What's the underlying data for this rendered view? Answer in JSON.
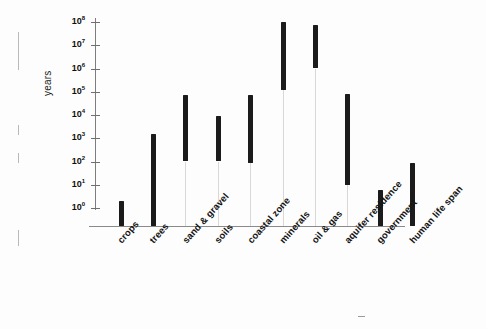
{
  "figure": {
    "ylabel": "years",
    "scan_artifacts": [
      "binding-mark",
      "binding-mark",
      "binding-mark",
      "binding-mark",
      "stray-dot"
    ]
  },
  "axis": {
    "ticks": [
      {
        "exp": "8",
        "base": "10",
        "value": 100000000
      },
      {
        "exp": "7",
        "base": "10",
        "value": 10000000
      },
      {
        "exp": "6",
        "base": "10",
        "value": 1000000
      },
      {
        "exp": "5",
        "base": "10",
        "value": 100000
      },
      {
        "exp": "4",
        "base": "10",
        "value": 10000
      },
      {
        "exp": "3",
        "base": "10",
        "value": 1000
      },
      {
        "exp": "2",
        "base": "10",
        "value": 100
      },
      {
        "exp": "1",
        "base": "10",
        "value": 10
      },
      {
        "exp": "0",
        "base": "10",
        "value": 1
      }
    ]
  },
  "chart_data": {
    "type": "bar",
    "title": "",
    "xlabel": "",
    "ylabel": "years",
    "scale": "log",
    "ylim": [
      1,
      100000000
    ],
    "grid": false,
    "legend": null,
    "orientation": "vertical",
    "bar_style": "floating range bars (low-high)",
    "categories": [
      "crops",
      "trees",
      "sand & gravel",
      "soils",
      "coastal zone",
      "minerals",
      "oil & gas",
      "aquifer residence",
      "government",
      "human life span"
    ],
    "series": [
      {
        "name": "renewal time range (years)",
        "low": [
          1,
          1,
          100,
          100,
          90,
          120000,
          1000000,
          10,
          1,
          1
        ],
        "high": [
          2,
          1600,
          70000,
          9000,
          70000,
          100000000,
          70000000,
          80000,
          6,
          85
        ]
      }
    ],
    "values_log10": [
      {
        "category": "crops",
        "low_log": 0.0,
        "high_log": 0.3
      },
      {
        "category": "trees",
        "low_log": 0.0,
        "high_log": 3.2
      },
      {
        "category": "sand & gravel",
        "low_log": 2.0,
        "high_log": 4.85
      },
      {
        "category": "soils",
        "low_log": 2.0,
        "high_log": 3.95
      },
      {
        "category": "coastal zone",
        "low_log": 1.95,
        "high_log": 4.85
      },
      {
        "category": "minerals",
        "low_log": 5.08,
        "high_log": 8.0
      },
      {
        "category": "oil & gas",
        "low_log": 6.0,
        "high_log": 7.85
      },
      {
        "category": "aquifer residence",
        "low_log": 1.0,
        "high_log": 4.9
      },
      {
        "category": "government",
        "low_log": 0.0,
        "high_log": 0.78
      },
      {
        "category": "human life span",
        "low_log": 0.0,
        "high_log": 1.93
      }
    ]
  }
}
